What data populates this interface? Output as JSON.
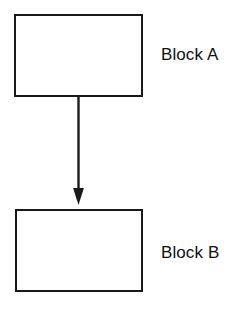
{
  "diagram": {
    "background_color": "#ffffff",
    "stroke_color": "#1a1a1a",
    "text_color": "#111111",
    "nodes": [
      {
        "id": "block-a",
        "label": "Block A",
        "shape": "rectangle",
        "x": 14,
        "y": 14,
        "width": 129,
        "height": 83
      },
      {
        "id": "block-b",
        "label": "Block B",
        "shape": "rectangle",
        "x": 15,
        "y": 209,
        "width": 128,
        "height": 83
      }
    ],
    "edges": [
      {
        "id": "a-to-b",
        "from": "block-a",
        "to": "block-b",
        "style": "solid",
        "arrowhead": "filled-triangle",
        "direction": "down"
      }
    ]
  }
}
